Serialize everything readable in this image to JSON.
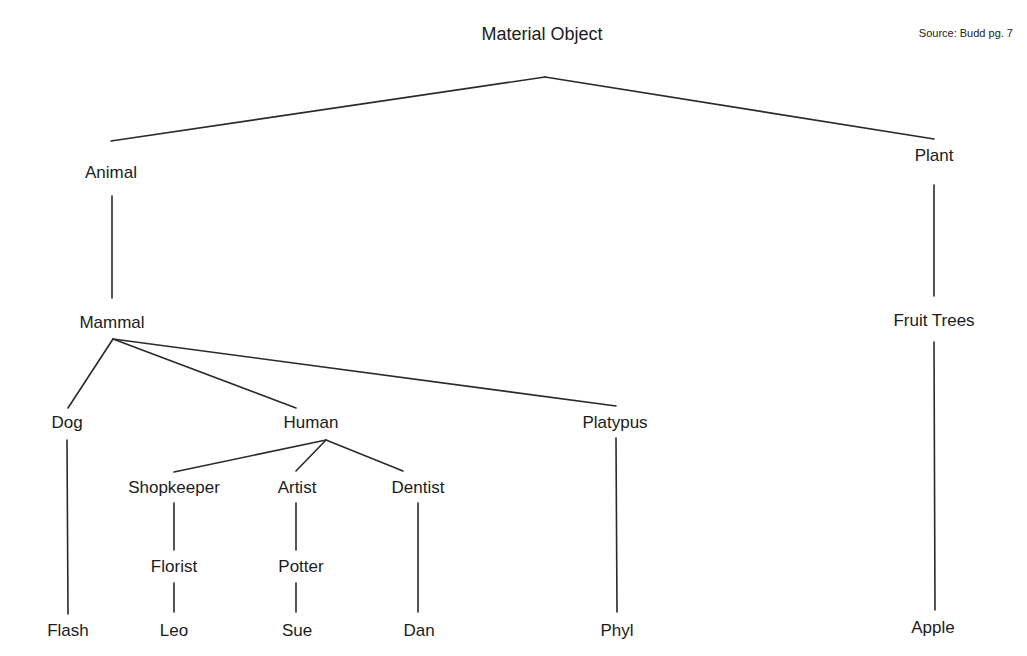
{
  "source_note": "Source: Budd pg. 7",
  "root": {
    "label": "Material Object",
    "x": 542,
    "y": 34
  },
  "nodes": {
    "animal": {
      "label": "Animal",
      "x": 111,
      "y": 173
    },
    "plant": {
      "label": "Plant",
      "x": 934,
      "y": 156
    },
    "mammal": {
      "label": "Mammal",
      "x": 112,
      "y": 323
    },
    "fruit_trees": {
      "label": "Fruit Trees",
      "x": 934,
      "y": 321
    },
    "dog": {
      "label": "Dog",
      "x": 67,
      "y": 423
    },
    "human": {
      "label": "Human",
      "x": 311,
      "y": 423
    },
    "platypus": {
      "label": "Platypus",
      "x": 615,
      "y": 423
    },
    "shopkeeper": {
      "label": "Shopkeeper",
      "x": 174,
      "y": 488
    },
    "artist": {
      "label": "Artist",
      "x": 297,
      "y": 488
    },
    "dentist": {
      "label": "Dentist",
      "x": 418,
      "y": 488
    },
    "florist": {
      "label": "Florist",
      "x": 174,
      "y": 567
    },
    "potter": {
      "label": "Potter",
      "x": 301,
      "y": 567
    },
    "flash": {
      "label": "Flash",
      "x": 68,
      "y": 631
    },
    "leo": {
      "label": "Leo",
      "x": 174,
      "y": 631
    },
    "sue": {
      "label": "Sue",
      "x": 297,
      "y": 631
    },
    "dan": {
      "label": "Dan",
      "x": 419,
      "y": 631
    },
    "phyl": {
      "label": "Phyl",
      "x": 617,
      "y": 631
    },
    "apple": {
      "label": "Apple",
      "x": 933,
      "y": 628
    }
  },
  "edges": [
    {
      "from": "Material Object",
      "to": "Animal",
      "x1": 545,
      "y1": 77,
      "x2": 111,
      "y2": 141
    },
    {
      "from": "Material Object",
      "to": "Plant",
      "x1": 545,
      "y1": 77,
      "x2": 934,
      "y2": 139
    },
    {
      "from": "Animal",
      "to": "Mammal",
      "x1": 112,
      "y1": 196,
      "x2": 112,
      "y2": 298
    },
    {
      "from": "Plant",
      "to": "Fruit Trees",
      "x1": 934,
      "y1": 185,
      "x2": 934,
      "y2": 296
    },
    {
      "from": "Mammal",
      "to": "Dog",
      "x1": 113,
      "y1": 339,
      "x2": 68,
      "y2": 408
    },
    {
      "from": "Mammal",
      "to": "Human",
      "x1": 113,
      "y1": 339,
      "x2": 296,
      "y2": 408
    },
    {
      "from": "Mammal",
      "to": "Platypus",
      "x1": 113,
      "y1": 339,
      "x2": 616,
      "y2": 406
    },
    {
      "from": "Human",
      "to": "Shopkeeper",
      "x1": 326,
      "y1": 440,
      "x2": 174,
      "y2": 472
    },
    {
      "from": "Human",
      "to": "Artist",
      "x1": 326,
      "y1": 440,
      "x2": 296,
      "y2": 471
    },
    {
      "from": "Human",
      "to": "Dentist",
      "x1": 326,
      "y1": 440,
      "x2": 403,
      "y2": 471
    },
    {
      "from": "Dog",
      "to": "Flash",
      "x1": 67,
      "y1": 440,
      "x2": 68,
      "y2": 614
    },
    {
      "from": "Shopkeeper",
      "to": "Florist",
      "x1": 174,
      "y1": 503,
      "x2": 174,
      "y2": 550
    },
    {
      "from": "Florist",
      "to": "Leo",
      "x1": 174,
      "y1": 583,
      "x2": 174,
      "y2": 612
    },
    {
      "from": "Artist",
      "to": "Potter",
      "x1": 296,
      "y1": 503,
      "x2": 296,
      "y2": 550
    },
    {
      "from": "Potter",
      "to": "Sue",
      "x1": 296,
      "y1": 583,
      "x2": 296,
      "y2": 612
    },
    {
      "from": "Dentist",
      "to": "Dan",
      "x1": 418,
      "y1": 503,
      "x2": 418,
      "y2": 612
    },
    {
      "from": "Platypus",
      "to": "Phyl",
      "x1": 616,
      "y1": 438,
      "x2": 617,
      "y2": 612
    },
    {
      "from": "Fruit Trees",
      "to": "Apple",
      "x1": 934,
      "y1": 342,
      "x2": 935,
      "y2": 610
    }
  ],
  "colors": {
    "background": "#ffffff",
    "line": "#2a2a2a",
    "text": "#1c1c1c"
  }
}
